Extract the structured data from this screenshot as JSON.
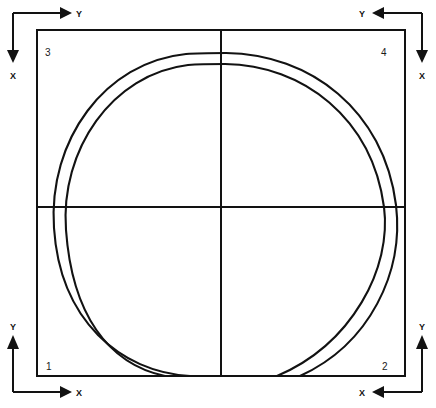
{
  "diagram": {
    "type": "engineering-schematic",
    "background_color": "#ffffff",
    "line_color": "#121212",
    "frame": {
      "left": 37,
      "top": 30,
      "right": 405,
      "bottom": 376,
      "stroke_width": 2
    },
    "center": {
      "x": 221,
      "y": 207,
      "vertical_line_label": "vertical-center-line",
      "horizontal_line_label": "horizontal-center-line"
    },
    "quadrants": [
      {
        "id": "q3",
        "number": "3",
        "position": "top-left",
        "label_x": 45,
        "label_y": 52,
        "y_axis_direction": "right",
        "x_axis_direction": "down",
        "y_label": "Y",
        "x_label": "X"
      },
      {
        "id": "q4",
        "number": "4",
        "position": "top-right",
        "label_x": 381,
        "label_y": 52,
        "y_axis_direction": "left",
        "x_axis_direction": "down",
        "y_label": "Y",
        "x_label": "X"
      },
      {
        "id": "q1",
        "number": "1",
        "position": "bottom-left",
        "label_x": 46,
        "label_y": 367,
        "y_axis_direction": "up",
        "x_axis_direction": "right",
        "y_label": "Y",
        "x_label": "X"
      },
      {
        "id": "q2",
        "number": "2",
        "position": "bottom-right",
        "label_x": 382,
        "label_y": 367,
        "y_axis_direction": "up",
        "x_axis_direction": "left",
        "y_label": "Y",
        "x_label": "X"
      }
    ],
    "arcs": {
      "count": 2,
      "description": "Two concentric near-circular arcs with a gap at the bottom center",
      "outer": {
        "name": "outer-arc",
        "center_x": 225,
        "center_y": 215,
        "radius_x": 172,
        "radius_y": 162,
        "gap_location": "bottom-center"
      },
      "inner": {
        "name": "inner-arc",
        "center_x": 225,
        "center_y": 215,
        "radius_x": 160,
        "radius_y": 152,
        "gap_location": "bottom-center"
      }
    }
  }
}
